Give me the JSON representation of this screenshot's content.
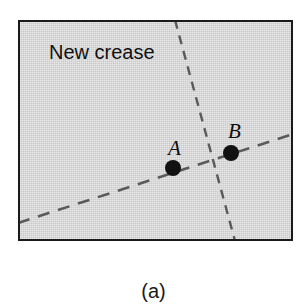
{
  "figure": {
    "caption": "(a)",
    "caption_x": 152,
    "caption_y": 281,
    "panel": {
      "x": 18,
      "y": 20,
      "width": 275,
      "height": 221,
      "fill_color": "#c9c9c9",
      "border_color": "#1a1a1a",
      "border_width": 2
    },
    "annotations": {
      "crease_text": "New crease",
      "crease_text_x": 47,
      "crease_text_y": 40
    },
    "points": [
      {
        "id": "A",
        "label": "A",
        "dot_x": 173,
        "dot_y": 168,
        "dot_radius": 8,
        "label_x": 166,
        "label_y": 136,
        "color": "#111111"
      },
      {
        "id": "B",
        "label": "B",
        "dot_x": 231,
        "dot_y": 153,
        "dot_radius": 8,
        "label_x": 226,
        "label_y": 119,
        "color": "#111111"
      }
    ],
    "lines": [
      {
        "id": "new-crease-line",
        "name": "New crease",
        "x1": 157,
        "y1": 0,
        "x2": 217,
        "y2": 221,
        "dash": "9 7",
        "stroke": "#5a5a5a",
        "stroke_width": 2.4
      },
      {
        "id": "ab-line",
        "name": "Line through A and B",
        "x1": 0,
        "y1": 203,
        "x2": 275,
        "y2": 114,
        "dash": "12 9",
        "stroke": "#5a5a5a",
        "stroke_width": 2.6
      }
    ],
    "intersection": {
      "x": 203,
      "y": 160
    }
  }
}
